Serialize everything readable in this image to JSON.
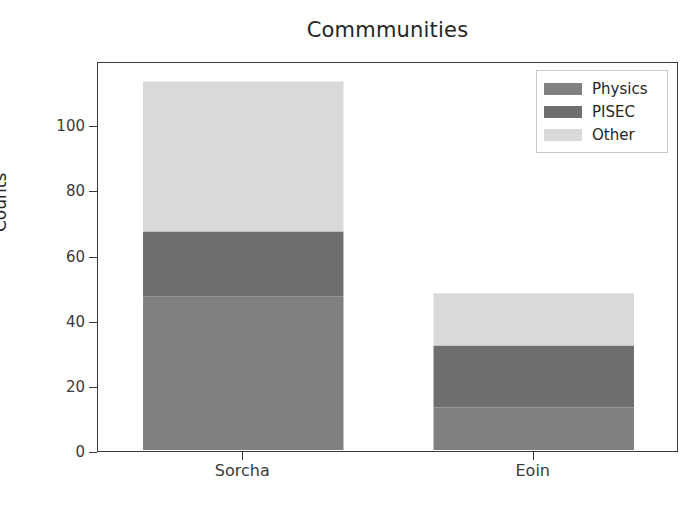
{
  "chart_data": {
    "type": "bar",
    "subtype": "stacked-bar",
    "title": "Commmunities",
    "xlabel": "",
    "ylabel": "Counts",
    "categories": [
      "Sorcha",
      "Eoin"
    ],
    "series": [
      {
        "name": "Physics",
        "values": [
          48,
          14
        ],
        "color": "#808080"
      },
      {
        "name": "PISEC",
        "values": [
          20,
          19
        ],
        "color": "#6e6e6e"
      },
      {
        "name": "Other",
        "values": [
          46,
          16
        ],
        "color": "#d9d9d9"
      }
    ],
    "totals": [
      114,
      49
    ],
    "stack_tops": {
      "Sorcha": {
        "Physics": 48,
        "PISEC": 68,
        "Other": 114
      },
      "Eoin": {
        "Physics": 14,
        "PISEC": 33,
        "Other": 49
      }
    },
    "ylim": [
      0,
      119.7
    ],
    "ytick_labels": [
      "0",
      "20",
      "40",
      "60",
      "80",
      "100"
    ],
    "ytick_values": [
      0,
      20,
      40,
      60,
      80,
      100
    ],
    "grid": false,
    "legend_position": "upper right",
    "legend_entries": [
      "Physics",
      "PISEC",
      "Other"
    ],
    "bar_width_fraction": 0.69
  },
  "axes": {
    "title": "Commmunities",
    "y_label": "Counts",
    "y_ticks": [
      {
        "label": "100",
        "value": 100
      },
      {
        "label": "80",
        "value": 80
      },
      {
        "label": "60",
        "value": 60
      },
      {
        "label": "40",
        "value": 40
      },
      {
        "label": "20",
        "value": 20
      },
      {
        "label": "0",
        "value": 0
      }
    ],
    "x_ticks": [
      {
        "label": "Sorcha"
      },
      {
        "label": "Eoin"
      }
    ]
  },
  "legend": {
    "items": [
      {
        "label": "Physics",
        "color": "#808080"
      },
      {
        "label": "PISEC",
        "color": "#6e6e6e"
      },
      {
        "label": "Other",
        "color": "#d9d9d9"
      }
    ]
  },
  "colors": {
    "physics": "#808080",
    "pisec": "#6e6e6e",
    "other": "#d9d9d9",
    "axis": "#3a3a3a",
    "text": "#262626",
    "background": "#ffffff"
  }
}
